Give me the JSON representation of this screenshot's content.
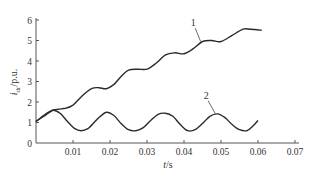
{
  "chart_data": {
    "type": "line",
    "title": "",
    "xlabel": "t/s",
    "ylabel": "i_dr/p.u.",
    "ylabel_main": "i",
    "ylabel_sub": "dr",
    "ylabel_tail": "/p.u.",
    "xlim": [
      0,
      0.07
    ],
    "ylim": [
      0,
      6
    ],
    "xticks": [
      0.01,
      0.02,
      0.03,
      0.04,
      0.05,
      0.06,
      0.07
    ],
    "xtick_labels": [
      "0.01",
      "0.02",
      "0.03",
      "0.04",
      "0.05",
      "0.06",
      "0.07"
    ],
    "yticks": [
      0,
      1,
      2,
      3,
      4,
      5,
      6
    ],
    "ytick_labels": [
      "0",
      "1",
      "2",
      "3",
      "4",
      "5",
      "6"
    ],
    "grid": false,
    "legend": "none (curves labeled inline)",
    "series": [
      {
        "name": "1",
        "label_pos": {
          "t": 0.0425,
          "v": 5.7
        },
        "label_anchor": {
          "t": 0.0445,
          "v": 4.95
        },
        "x": [
          0,
          0.0025,
          0.0046,
          0.006,
          0.008,
          0.01,
          0.0125,
          0.015,
          0.017,
          0.019,
          0.021,
          0.023,
          0.025,
          0.0275,
          0.03,
          0.0325,
          0.035,
          0.0375,
          0.04,
          0.0425,
          0.045,
          0.0475,
          0.05,
          0.053,
          0.056,
          0.058,
          0.061
        ],
        "values": [
          1.05,
          1.35,
          1.6,
          1.65,
          1.7,
          1.85,
          2.3,
          2.65,
          2.7,
          2.65,
          2.85,
          3.25,
          3.55,
          3.6,
          3.6,
          3.9,
          4.3,
          4.4,
          4.35,
          4.6,
          4.95,
          5.0,
          4.95,
          5.25,
          5.55,
          5.55,
          5.5
        ]
      },
      {
        "name": "2",
        "label_pos": {
          "t": 0.046,
          "v": 2.15
        },
        "label_anchor": {
          "t": 0.0485,
          "v": 1.42
        },
        "x": [
          0,
          0.0025,
          0.0046,
          0.0065,
          0.0085,
          0.0105,
          0.0122,
          0.014,
          0.0165,
          0.019,
          0.021,
          0.023,
          0.025,
          0.027,
          0.029,
          0.031,
          0.033,
          0.035,
          0.037,
          0.039,
          0.041,
          0.043,
          0.045,
          0.047,
          0.049,
          0.051,
          0.053,
          0.055,
          0.057,
          0.0585,
          0.06
        ],
        "values": [
          1.05,
          1.4,
          1.6,
          1.45,
          1.05,
          0.7,
          0.6,
          0.7,
          1.15,
          1.5,
          1.35,
          0.95,
          0.65,
          0.6,
          0.75,
          1.1,
          1.4,
          1.45,
          1.3,
          0.9,
          0.6,
          0.65,
          0.95,
          1.3,
          1.42,
          1.25,
          0.9,
          0.65,
          0.6,
          0.8,
          1.1
        ]
      }
    ]
  }
}
